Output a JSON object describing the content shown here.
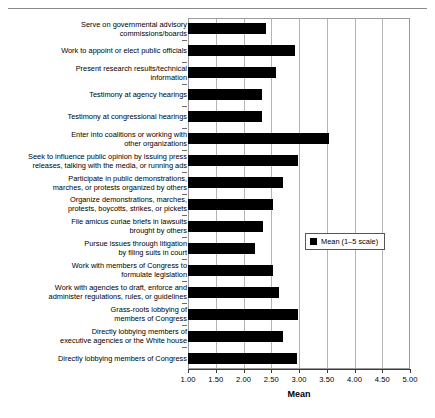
{
  "chart_data": {
    "type": "bar",
    "orientation": "horizontal",
    "title": "",
    "xlabel": "Mean",
    "ylabel": "",
    "xlim": [
      1.0,
      5.0
    ],
    "xticks": [
      "1.00",
      "1.50",
      "2.00",
      "2.50",
      "3.00",
      "3.50",
      "4.00",
      "4.50",
      "5.00"
    ],
    "xtick_values": [
      1.0,
      1.5,
      2.0,
      2.5,
      3.0,
      3.5,
      4.0,
      4.5,
      5.0
    ],
    "grid": true,
    "legend": {
      "position": "center-right",
      "entries": [
        "Mean (1–5 scale)"
      ]
    },
    "series_name": "Mean (1–5 scale)",
    "bar_color": "#000000",
    "categories": [
      "Serve on governmental advisory commissions/boards",
      "Work to appoint or elect public officials",
      "Present research results/technical information",
      "Testimony at agency hearings",
      "Testimony at congressional hearings",
      "Enter into coalitions or working with other organizations",
      "Seek to influence public opinion by issuing press releases, talking with the media, or running ads",
      "Participate in public demonstrations, marches, or protests organized by others",
      "Organize demonstrations, marches, protests, boycotts, strikes, or pickets",
      "File amicus curiae briefs in lawsuits brought by others",
      "Pursue issues through litigation by filing suits in court",
      "Work with members of Congress to formulate legislation",
      "Work with agencies to draft, enforce and administer regulations, rules, or guidelines",
      "Grass-roots lobbying of members of Congress",
      "Directly lobbying members of executive agencies or the White house",
      "Directly lobbying members of Congress"
    ],
    "category_lines": [
      [
        "Serve on governmental advisory",
        "commissions/boards"
      ],
      [
        "Work to appoint or elect public officials"
      ],
      [
        "Present research results/technical",
        "information"
      ],
      [
        "Testimony at agency hearings"
      ],
      [
        "Testimony at congressional hearings"
      ],
      [
        "Enter into coalitions or working with",
        "other organizations"
      ],
      [
        "Seek to influence public opinion by issuing press",
        "releases, talking with the media, or running ads"
      ],
      [
        "Participate in public demonstrations,",
        "marches, or protests organized by others"
      ],
      [
        "Organize demonstrations, marches,",
        "protests, boycotts, strikes, or pickets"
      ],
      [
        "File amicus curiae briefs in lawsuits",
        "brought by others"
      ],
      [
        "Pursue issues through litigation",
        "by filing suits in court"
      ],
      [
        "Work with members of Congress to",
        "formulate legislation"
      ],
      [
        "Work with agencies to draft, enforce and",
        "administer regulations, rules, or guidelines"
      ],
      [
        "Grass-roots lobbying of",
        "members of Congress"
      ],
      [
        "Directly lobbying members of",
        "executive agencies or the White house"
      ],
      [
        "Directly lobbying members of Congress"
      ]
    ],
    "values": [
      2.4,
      2.93,
      2.58,
      2.34,
      2.33,
      3.54,
      2.98,
      2.71,
      2.53,
      2.36,
      2.21,
      2.54,
      2.64,
      2.98,
      2.72,
      2.96
    ]
  }
}
